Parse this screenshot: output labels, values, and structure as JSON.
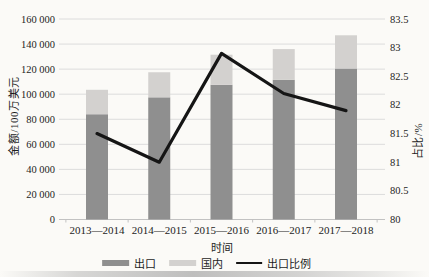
{
  "figure": {
    "background": "#fbfaf7",
    "grid_color": "#dcdcdc",
    "axis_color": "#c2c2c2",
    "text_color": "#1d1d1d"
  },
  "chart_data": {
    "type": "bar",
    "subtype": "stacked-bar-with-line",
    "categories": [
      "2013—2014",
      "2014—2015",
      "2015—2016",
      "2016—2017",
      "2017—2018"
    ],
    "series": [
      {
        "name": "出口",
        "role": "bar-stack-bottom",
        "color": "#8f8f8f",
        "values": [
          84000,
          97500,
          107500,
          111500,
          120500
        ]
      },
      {
        "name": "国内",
        "role": "bar-stack-top",
        "color": "#d3d1cf",
        "values": [
          19500,
          20000,
          24000,
          24500,
          26500
        ]
      },
      {
        "name": "出口比例",
        "role": "line",
        "axis": "right",
        "color": "#151515",
        "values": [
          81.5,
          81.0,
          82.9,
          82.2,
          81.9
        ]
      }
    ],
    "left_axis": {
      "label": "金额/100万美元",
      "min": 0,
      "max": 160000,
      "tick_step": 20000,
      "tick_labels": [
        "0",
        "20 000",
        "40 000",
        "60 000",
        "80 000",
        "100 000",
        "120 000",
        "140 000",
        "160 000"
      ]
    },
    "right_axis": {
      "label": "占比/%",
      "min": 80,
      "max": 83.5,
      "tick_step": 0.5,
      "tick_labels": [
        "80",
        "80.5",
        "81",
        "81.5",
        "82",
        "82.5",
        "83",
        "83.5"
      ]
    },
    "x_axis": {
      "label": "时间"
    },
    "legend": {
      "position": "bottom",
      "entries": [
        "出口",
        "国内",
        "出口比例"
      ]
    },
    "grid": true,
    "title": ""
  }
}
